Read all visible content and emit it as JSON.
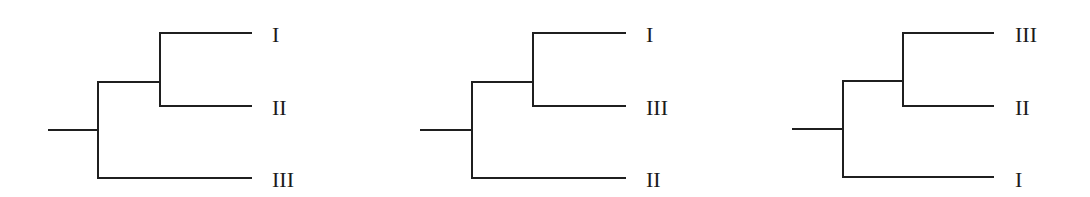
{
  "diagram": {
    "type": "phylogenetic-trees",
    "line_color": "#1f1f1f",
    "label_color": "#1a1a1a",
    "trees": [
      {
        "id": "tree-1",
        "topology": "((I,II),III)",
        "leaves": [
          "I",
          "II",
          "III"
        ],
        "geom": {
          "root_x0": 48,
          "root_x1": 98,
          "root_y": 130,
          "node_x": 98,
          "node_top": 82,
          "node_bottom": 178,
          "inner_x": 160,
          "inner_top": 33,
          "inner_bottom": 106,
          "leaf_x1": 252,
          "label_x": 272
        }
      },
      {
        "id": "tree-2",
        "topology": "((I,III),II)",
        "leaves": [
          "I",
          "III",
          "II"
        ],
        "geom": {
          "root_x0": 420,
          "root_x1": 472,
          "root_y": 130,
          "node_x": 472,
          "node_top": 82,
          "node_bottom": 178,
          "inner_x": 533,
          "inner_top": 33,
          "inner_bottom": 106,
          "leaf_x1": 626,
          "label_x": 646
        }
      },
      {
        "id": "tree-3",
        "topology": "((III,II),I)",
        "leaves": [
          "III",
          "II",
          "I"
        ],
        "geom": {
          "root_x0": 792,
          "root_x1": 843,
          "root_y": 129,
          "node_x": 843,
          "node_top": 81,
          "node_bottom": 177,
          "inner_x": 903,
          "inner_top": 33,
          "inner_bottom": 106,
          "leaf_x1": 994,
          "label_x": 1015
        }
      }
    ]
  }
}
